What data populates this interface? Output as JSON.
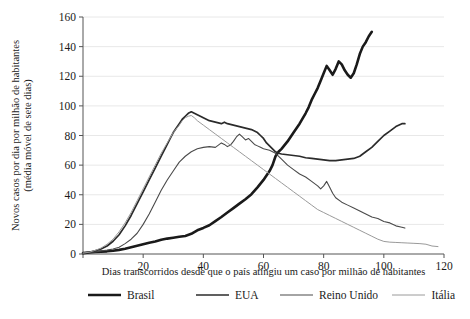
{
  "chart_data": {
    "type": "line",
    "title": "",
    "xlabel": "Dias transcorridos desde que o país atingiu um caso por milhão de habitantes",
    "ylabel_line1": "Novos casos por dia por milhão de habitantes",
    "ylabel_line2": "(média móvel de sete dias)",
    "xlim": [
      0,
      120
    ],
    "ylim": [
      0,
      160
    ],
    "xticks": [
      0,
      20,
      40,
      60,
      80,
      100,
      120
    ],
    "xtick_labels": [
      "",
      "20",
      "40",
      "60",
      "80",
      "100",
      "120"
    ],
    "yticks": [
      0,
      20,
      40,
      60,
      80,
      100,
      120,
      140,
      160
    ],
    "ytick_labels": [
      "0",
      "20",
      "40",
      "60",
      "80",
      "100",
      "120",
      "140",
      "160"
    ],
    "grid": "horizontal",
    "legend_position": "bottom",
    "series": [
      {
        "name": "Brasil",
        "color": "#1a1a1a",
        "width": 2.6,
        "points": [
          [
            0,
            0.6
          ],
          [
            2,
            1.0
          ],
          [
            4,
            1.4
          ],
          [
            6,
            1.6
          ],
          [
            8,
            1.8
          ],
          [
            10,
            2.2
          ],
          [
            12,
            2.8
          ],
          [
            14,
            3.6
          ],
          [
            16,
            4.6
          ],
          [
            18,
            5.6
          ],
          [
            20,
            6.6
          ],
          [
            22,
            7.6
          ],
          [
            24,
            8.4
          ],
          [
            26,
            9.6
          ],
          [
            28,
            10.4
          ],
          [
            30,
            11.0
          ],
          [
            32,
            11.6
          ],
          [
            34,
            12.2
          ],
          [
            36,
            13.6
          ],
          [
            38,
            16.0
          ],
          [
            40,
            17.6
          ],
          [
            42,
            19.4
          ],
          [
            44,
            22.2
          ],
          [
            46,
            25.0
          ],
          [
            48,
            28.0
          ],
          [
            50,
            31.0
          ],
          [
            52,
            34.0
          ],
          [
            54,
            37.0
          ],
          [
            56,
            40.4
          ],
          [
            58,
            45.0
          ],
          [
            60,
            50.0
          ],
          [
            62,
            56.0
          ],
          [
            63,
            60.0
          ],
          [
            64,
            66.0
          ],
          [
            65,
            69.0
          ],
          [
            66,
            71.0
          ],
          [
            68,
            76.0
          ],
          [
            70,
            82.0
          ],
          [
            72,
            88.0
          ],
          [
            74,
            95.0
          ],
          [
            75,
            99.0
          ],
          [
            76,
            104.0
          ],
          [
            77,
            108.0
          ],
          [
            78,
            112.0
          ],
          [
            79,
            117.0
          ],
          [
            80,
            122.0
          ],
          [
            81,
            127.0
          ],
          [
            82,
            124.0
          ],
          [
            83,
            121.0
          ],
          [
            84,
            125.0
          ],
          [
            85,
            130.0
          ],
          [
            86,
            128.0
          ],
          [
            87,
            124.0
          ],
          [
            88,
            121.0
          ],
          [
            89,
            119.0
          ],
          [
            90,
            122.0
          ],
          [
            91,
            128.0
          ],
          [
            92,
            135.0
          ],
          [
            93,
            140.0
          ],
          [
            94,
            143.0
          ],
          [
            95,
            147.0
          ],
          [
            96,
            150.0
          ]
        ]
      },
      {
        "name": "EUA",
        "color": "#2b2b2b",
        "width": 1.7,
        "points": [
          [
            0,
            0.6
          ],
          [
            2,
            1.2
          ],
          [
            4,
            2.2
          ],
          [
            6,
            3.4
          ],
          [
            8,
            5.4
          ],
          [
            10,
            8.6
          ],
          [
            12,
            13.0
          ],
          [
            14,
            19.0
          ],
          [
            16,
            26.0
          ],
          [
            18,
            34.0
          ],
          [
            20,
            42.0
          ],
          [
            22,
            50.0
          ],
          [
            24,
            58.0
          ],
          [
            26,
            66.0
          ],
          [
            28,
            74.0
          ],
          [
            29,
            78.0
          ],
          [
            30,
            82.0
          ],
          [
            32,
            88.0
          ],
          [
            33,
            91.0
          ],
          [
            34,
            93.0
          ],
          [
            35,
            95.0
          ],
          [
            36,
            96.0
          ],
          [
            37,
            95.0
          ],
          [
            38,
            94.0
          ],
          [
            40,
            92.0
          ],
          [
            42,
            90.0
          ],
          [
            44,
            89.0
          ],
          [
            46,
            88.0
          ],
          [
            47,
            89.0
          ],
          [
            48,
            88.0
          ],
          [
            50,
            87.0
          ],
          [
            52,
            86.0
          ],
          [
            54,
            85.0
          ],
          [
            56,
            84.0
          ],
          [
            58,
            82.0
          ],
          [
            59,
            80.0
          ],
          [
            60,
            78.0
          ],
          [
            61,
            75.0
          ],
          [
            62,
            73.0
          ],
          [
            63,
            71.0
          ],
          [
            64,
            69.0
          ],
          [
            65,
            68.0
          ],
          [
            66,
            67.5
          ],
          [
            68,
            67.0
          ],
          [
            70,
            66.5
          ],
          [
            72,
            66.0
          ],
          [
            74,
            65.0
          ],
          [
            76,
            64.5
          ],
          [
            78,
            64.0
          ],
          [
            80,
            63.5
          ],
          [
            82,
            63.0
          ],
          [
            84,
            63.0
          ],
          [
            86,
            63.5
          ],
          [
            88,
            64.0
          ],
          [
            90,
            64.5
          ],
          [
            92,
            66.0
          ],
          [
            94,
            69.0
          ],
          [
            96,
            72.0
          ],
          [
            98,
            76.0
          ],
          [
            100,
            80.0
          ],
          [
            102,
            83.0
          ],
          [
            104,
            86.0
          ],
          [
            106,
            88.0
          ],
          [
            107,
            88.0
          ]
        ]
      },
      {
        "name": "Reino Unido",
        "color": "#4a4a4a",
        "width": 1.1,
        "points": [
          [
            0,
            0.6
          ],
          [
            2,
            1.0
          ],
          [
            4,
            1.4
          ],
          [
            6,
            2.0
          ],
          [
            8,
            2.6
          ],
          [
            10,
            3.4
          ],
          [
            12,
            4.6
          ],
          [
            14,
            7.0
          ],
          [
            16,
            10.0
          ],
          [
            18,
            14.0
          ],
          [
            20,
            20.0
          ],
          [
            22,
            27.0
          ],
          [
            24,
            35.0
          ],
          [
            26,
            43.0
          ],
          [
            28,
            50.0
          ],
          [
            30,
            56.0
          ],
          [
            32,
            62.0
          ],
          [
            34,
            66.0
          ],
          [
            36,
            69.0
          ],
          [
            38,
            71.0
          ],
          [
            40,
            72.0
          ],
          [
            42,
            72.5
          ],
          [
            44,
            72.0
          ],
          [
            45,
            73.5
          ],
          [
            46,
            75.0
          ],
          [
            47,
            74.0
          ],
          [
            48,
            72.5
          ],
          [
            49,
            73.5
          ],
          [
            50,
            76.0
          ],
          [
            51,
            79.0
          ],
          [
            52,
            81.0
          ],
          [
            53,
            79.0
          ],
          [
            54,
            77.0
          ],
          [
            55,
            78.0
          ],
          [
            56,
            76.0
          ],
          [
            57,
            74.0
          ],
          [
            58,
            73.0
          ],
          [
            59,
            72.0
          ],
          [
            60,
            71.0
          ],
          [
            62,
            70.0
          ],
          [
            64,
            68.0
          ],
          [
            66,
            64.0
          ],
          [
            68,
            60.0
          ],
          [
            70,
            57.0
          ],
          [
            72,
            54.0
          ],
          [
            74,
            52.0
          ],
          [
            76,
            49.0
          ],
          [
            78,
            46.0
          ],
          [
            79,
            44.0
          ],
          [
            80,
            46.0
          ],
          [
            81,
            49.0
          ],
          [
            82,
            45.0
          ],
          [
            83,
            41.0
          ],
          [
            84,
            38.0
          ],
          [
            86,
            35.0
          ],
          [
            88,
            33.0
          ],
          [
            90,
            31.0
          ],
          [
            92,
            29.0
          ],
          [
            94,
            27.0
          ],
          [
            96,
            25.0
          ],
          [
            98,
            24.0
          ],
          [
            100,
            22.0
          ],
          [
            102,
            21.0
          ],
          [
            104,
            19.0
          ],
          [
            106,
            18.0
          ],
          [
            107,
            17.5
          ]
        ]
      },
      {
        "name": "Itália",
        "color": "#9a9a9a",
        "width": 1.0,
        "points": [
          [
            0,
            0.6
          ],
          [
            2,
            1.2
          ],
          [
            4,
            2.4
          ],
          [
            6,
            4.0
          ],
          [
            8,
            6.6
          ],
          [
            10,
            10.0
          ],
          [
            12,
            15.0
          ],
          [
            14,
            21.0
          ],
          [
            16,
            28.0
          ],
          [
            18,
            36.0
          ],
          [
            20,
            44.0
          ],
          [
            22,
            52.0
          ],
          [
            24,
            60.0
          ],
          [
            26,
            68.0
          ],
          [
            28,
            75.0
          ],
          [
            30,
            82.0
          ],
          [
            32,
            87.0
          ],
          [
            33,
            90.0
          ],
          [
            34,
            92.0
          ],
          [
            35,
            93.0
          ],
          [
            36,
            93.5
          ],
          [
            37,
            92.0
          ],
          [
            38,
            90.0
          ],
          [
            40,
            87.0
          ],
          [
            42,
            84.0
          ],
          [
            44,
            81.0
          ],
          [
            46,
            78.0
          ],
          [
            48,
            75.0
          ],
          [
            50,
            72.0
          ],
          [
            52,
            69.0
          ],
          [
            54,
            66.0
          ],
          [
            56,
            63.0
          ],
          [
            58,
            60.0
          ],
          [
            60,
            57.0
          ],
          [
            62,
            54.0
          ],
          [
            64,
            51.0
          ],
          [
            66,
            48.0
          ],
          [
            68,
            45.0
          ],
          [
            70,
            42.0
          ],
          [
            72,
            39.0
          ],
          [
            74,
            36.0
          ],
          [
            76,
            33.0
          ],
          [
            78,
            30.0
          ],
          [
            80,
            28.0
          ],
          [
            82,
            26.0
          ],
          [
            84,
            24.0
          ],
          [
            86,
            22.0
          ],
          [
            88,
            20.0
          ],
          [
            90,
            18.0
          ],
          [
            92,
            16.0
          ],
          [
            94,
            14.0
          ],
          [
            96,
            12.0
          ],
          [
            98,
            10.0
          ],
          [
            100,
            8.5
          ],
          [
            102,
            8.0
          ],
          [
            104,
            7.8
          ],
          [
            106,
            7.6
          ],
          [
            108,
            7.4
          ],
          [
            110,
            7.2
          ],
          [
            112,
            7.0
          ],
          [
            114,
            6.6
          ],
          [
            116,
            5.4
          ],
          [
            118,
            5.0
          ]
        ]
      }
    ],
    "legend": [
      {
        "label": "Brasil",
        "color": "#1a1a1a",
        "width": 2.6
      },
      {
        "label": "EUA",
        "color": "#2b2b2b",
        "width": 1.7
      },
      {
        "label": "Reino Unido",
        "color": "#4a4a4a",
        "width": 1.1
      },
      {
        "label": "Itália",
        "color": "#9a9a9a",
        "width": 1.0
      }
    ]
  },
  "style": {
    "grid_color": "#e8e8e8",
    "axis_color": "#555555",
    "background": "#ffffff"
  }
}
